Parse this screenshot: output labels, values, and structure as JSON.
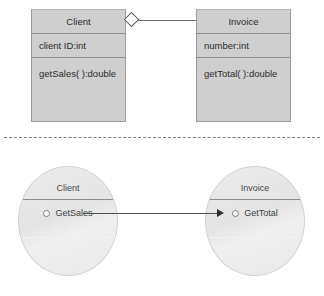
{
  "diagram": {
    "separator": "dashed-horizontal-rule"
  },
  "class_diagram": {
    "classes": [
      {
        "id": "client",
        "name": "Client",
        "attribute": "client ID:int",
        "method": "getSales( ):double"
      },
      {
        "id": "invoice",
        "name": "Invoice",
        "attribute": "number:int",
        "method": "getTotal( ):double"
      }
    ],
    "relationship": {
      "type": "aggregation",
      "marker": "hollow-diamond",
      "from": "Client",
      "to": "Invoice"
    }
  },
  "collaboration_diagram": {
    "objects": [
      {
        "id": "client-object",
        "name": "Client",
        "member": "GetSales",
        "bullet": "hollow-circle"
      },
      {
        "id": "invoice-object",
        "name": "Invoice",
        "member": "GetTotal",
        "bullet": "hollow-circle"
      }
    ],
    "message": {
      "type": "directed-arrow",
      "marker": "solid-arrowhead",
      "from": "GetSales",
      "to": "GetTotal"
    }
  },
  "colors": {
    "class_box_fill": "#cfcfcf",
    "class_box_border": "#9a9a9a",
    "circle_fill": "#e9e9e9",
    "circle_border": "#d2d2d2",
    "line": "#4f4f4f",
    "text": "#2b2b2b",
    "background": "#ffffff"
  }
}
